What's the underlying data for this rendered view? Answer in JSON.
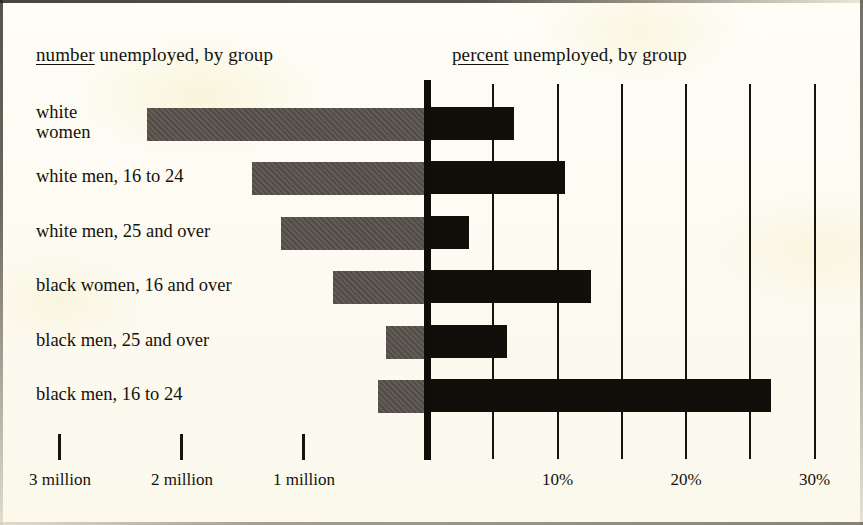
{
  "headings": {
    "left_lead": "number",
    "left_rest": " unemployed, by group",
    "right_lead": "percent",
    "right_rest": " unemployed, by group"
  },
  "chart_data": {
    "type": "bar",
    "orientation": "horizontal",
    "layout": "bidirectional back-to-back bars sharing one baseline",
    "grid": true,
    "legend": null,
    "categories": [
      "white\nwomen",
      "white men, 16 to 24",
      "white men, 25 and over",
      "black women, 16 and over",
      "black men, 25 and over",
      "black men, 16 to 24"
    ],
    "series": [
      {
        "name": "number unemployed",
        "direction": "left",
        "unit": "millions",
        "xlabel": "number unemployed",
        "values": [
          2.27,
          1.41,
          1.17,
          0.75,
          0.31,
          0.38
        ]
      },
      {
        "name": "percent unemployed",
        "direction": "right",
        "unit": "percent",
        "xlabel": "percent unemployed",
        "values": [
          6.5,
          10.5,
          3.0,
          12.5,
          6.0,
          26.5
        ]
      }
    ],
    "left_axis": {
      "ticks": [
        3,
        2,
        1
      ],
      "tick_labels": [
        "3 million",
        "2 million",
        "1 million"
      ],
      "xlim": [
        3.4,
        0
      ]
    },
    "right_axis": {
      "ticks": [
        5,
        10,
        15,
        20,
        25,
        30
      ],
      "tick_labels": [
        "",
        "10%",
        "",
        "20%",
        "",
        "30%"
      ],
      "xlim": [
        0,
        30.5
      ]
    }
  }
}
